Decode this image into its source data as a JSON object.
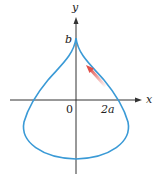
{
  "diagram": {
    "type": "parametric-curve",
    "axes": {
      "x_label": "x",
      "y_label": "y"
    },
    "labels": {
      "cusp": "b",
      "origin": "0",
      "x_intercept": "2a"
    },
    "colors": {
      "curve": "#3a9ad6",
      "axes": "#333333",
      "arrow": "#e0504a"
    }
  }
}
